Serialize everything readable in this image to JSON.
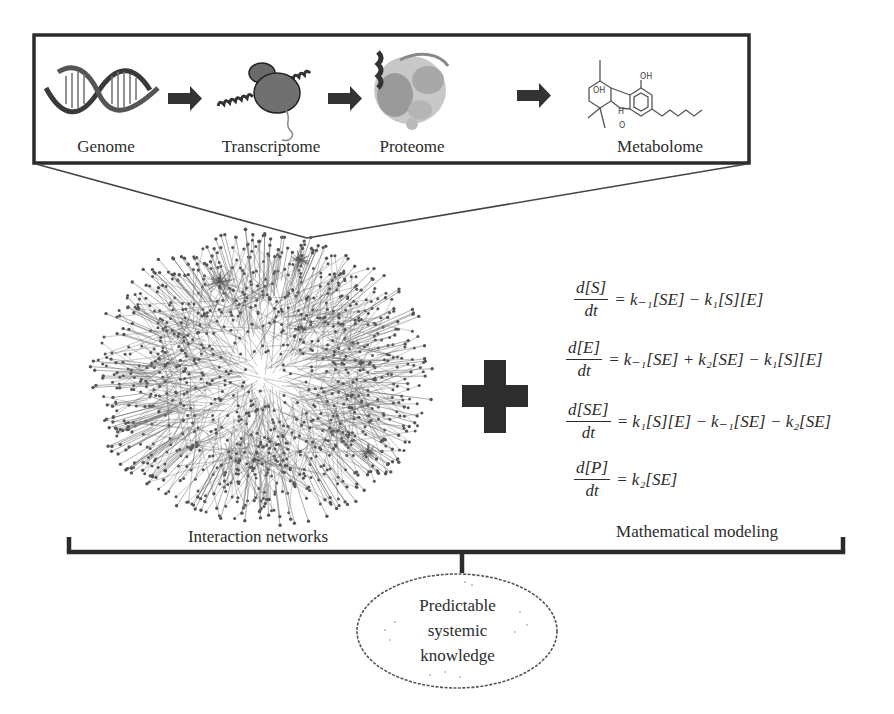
{
  "omics_pipeline": {
    "stages": [
      {
        "label": "Genome",
        "icon": "dna-helix-icon"
      },
      {
        "label": "Transcriptome",
        "icon": "ribosome-mrna-icon"
      },
      {
        "label": "Proteome",
        "icon": "protein-structure-icon"
      },
      {
        "label": "Metabolome",
        "icon": "chemical-structure-icon"
      }
    ],
    "arrow_icon": "right-arrow-icon",
    "metabolite_atoms": {
      "oh1": "OH",
      "oh2": "OH",
      "h": "H",
      "o": "O"
    }
  },
  "network": {
    "label": "Interaction networks",
    "icon": "interaction-network-graph"
  },
  "operator": {
    "icon": "plus-icon"
  },
  "modeling": {
    "label": "Mathematical modeling",
    "equations": [
      {
        "numerator": "d[S]",
        "denominator": "dt",
        "rhs": "= k₋₁[SE] − k₁[S][E]"
      },
      {
        "numerator": "d[E]",
        "denominator": "dt",
        "rhs": "= k₋₁[SE] + k₂[SE] − k₁[S][E]"
      },
      {
        "numerator": "d[SE]",
        "denominator": "dt",
        "rhs": "= k₁[S][E] − k₋₁[SE] − k₂[SE]"
      },
      {
        "numerator": "d[P]",
        "denominator": "dt",
        "rhs": "= k₂[SE]"
      }
    ]
  },
  "outcome": {
    "lines": [
      "Predictable",
      "systemic",
      "knowledge"
    ]
  },
  "colors": {
    "ink": "#2b2b2b",
    "network": "#555555",
    "plus": "#2d2d2d"
  }
}
